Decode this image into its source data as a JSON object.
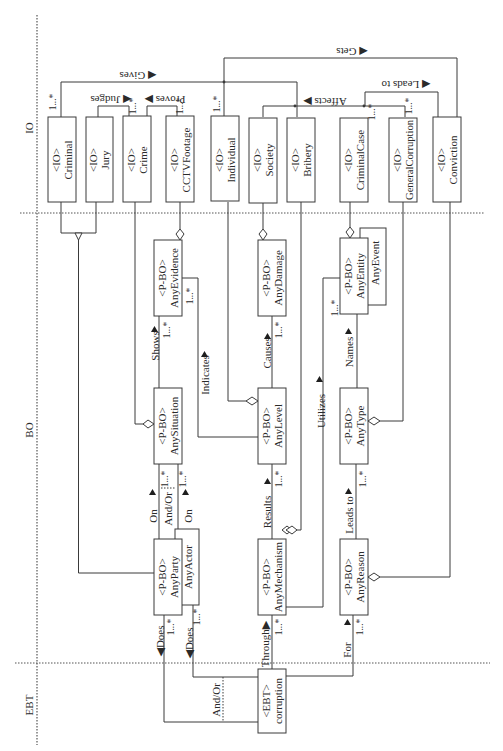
{
  "diagram": {
    "type": "UML class diagram (rotated 90°)",
    "zones": [
      {
        "id": "IO",
        "label": "IO"
      },
      {
        "id": "BO",
        "label": "BO"
      },
      {
        "id": "EBT",
        "label": "EBT"
      }
    ],
    "io_classes": [
      {
        "id": "criminal",
        "stereotype": "<IO>",
        "name": "Criminal"
      },
      {
        "id": "jury",
        "stereotype": "<IO>",
        "name": "Jury"
      },
      {
        "id": "crime",
        "stereotype": "<IO>",
        "name": "Crime"
      },
      {
        "id": "cctv",
        "stereotype": "<IO>",
        "name": "CCTVFootage"
      },
      {
        "id": "individual",
        "stereotype": "<IO>",
        "name": "Individual"
      },
      {
        "id": "society",
        "stereotype": "<IO>",
        "name": "Society"
      },
      {
        "id": "bribery",
        "stereotype": "<IO>",
        "name": "Bribery"
      },
      {
        "id": "criminalcase",
        "stereotype": "<IO>",
        "name": "CriminalCase"
      },
      {
        "id": "generalcorruption",
        "stereotype": "<IO>",
        "name": "GeneralCorruption"
      },
      {
        "id": "conviction",
        "stereotype": "<IO>",
        "name": "Conviction"
      }
    ],
    "bo_classes": [
      {
        "id": "anyevidence",
        "stereotype": "<P-BO>",
        "name": "AnyEvidence"
      },
      {
        "id": "anydamage",
        "stereotype": "<P-BO>",
        "name": "AnyDamage"
      },
      {
        "id": "anyentity",
        "stereotype": "<P-BO>",
        "name": "AnyEntity"
      },
      {
        "id": "anysituation",
        "stereotype": "<P-BO>",
        "name": "AnySituation"
      },
      {
        "id": "anylevel",
        "stereotype": "<P-BO>",
        "name": "AnyLevel"
      },
      {
        "id": "anytype",
        "stereotype": "<P-BO>",
        "name": "AnyType"
      },
      {
        "id": "anyparty",
        "stereotype": "<P-BO>",
        "name": "AnyParty"
      },
      {
        "id": "anymechanism",
        "stereotype": "<P-BO>",
        "name": "AnyMechanism"
      },
      {
        "id": "anyreason",
        "stereotype": "<P-BO>",
        "name": "AnyReason"
      }
    ],
    "sub_classes": {
      "anyevent": "AnyEvent",
      "anyactor": "AnyActor"
    },
    "ebt_class": {
      "stereotype": "<EBT>",
      "name": "corruption"
    },
    "associations": {
      "gives": "◀ Gives",
      "gets": "◀ Gets",
      "judges": "◀ Judges",
      "proves": "Proves ▶",
      "affects": "Affects ▶",
      "leads_to_io": "◀ Leads to",
      "shows": "Shows",
      "indicates": "Indicates",
      "causes": "Causes",
      "names": "Names",
      "utilizes": "Utilizes",
      "on1": "On",
      "on2": "On",
      "andor_bo": "And/Or",
      "results": "Results",
      "leads_to_bo": "Leads to",
      "does1": "◀Does",
      "does2": "◀Does",
      "through": "Through▶",
      "for": "For",
      "andor_ebt": "And/Or"
    },
    "multiplicity": "1...*"
  }
}
